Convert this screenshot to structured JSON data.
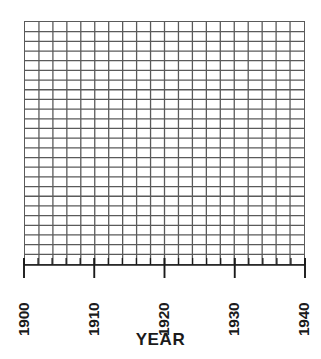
{
  "chart_data": {
    "type": "line",
    "title": "",
    "subtitle": "",
    "xlabel": "YEAR",
    "ylabel": "",
    "xlim": [
      1900,
      1940
    ],
    "ylim": [
      0,
      25
    ],
    "x_tick_labels": [
      "1900",
      "1910",
      "1920",
      "1930",
      "1940"
    ],
    "x_tick_values": [
      1900,
      1910,
      1920,
      1930,
      1940
    ],
    "y_tick_labels": [],
    "x_minor_tick_interval": 2,
    "grid": true,
    "grid_columns": 20,
    "grid_rows": 25,
    "legend": [],
    "series": [],
    "annotations": []
  },
  "figure": {
    "axis_title": "YEAR",
    "tick_labels": [
      {
        "text": "1900",
        "left_px": 16
      },
      {
        "text": "1910",
        "left_px": 86
      },
      {
        "text": "1920",
        "left_px": 156
      },
      {
        "text": "1930",
        "left_px": 226
      },
      {
        "text": "1940",
        "left_px": 296
      }
    ],
    "colors": {
      "grid_line": "#5a5a5a",
      "axis_line": "#1a1a1a",
      "text": "#1a1a1a",
      "plot_background": "#ffffff",
      "page_background": "#ffffff"
    }
  }
}
